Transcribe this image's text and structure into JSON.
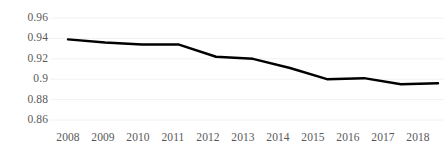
{
  "chart_data": {
    "type": "line",
    "title": "",
    "subtitle": "",
    "xlabel": "",
    "ylabel": "",
    "categories": [
      "2008",
      "2009",
      "2010",
      "2011",
      "2012",
      "2013",
      "2014",
      "2015",
      "2016",
      "2017",
      "2018"
    ],
    "x": [
      2008,
      2009,
      2010,
      2011,
      2012,
      2013,
      2014,
      2015,
      2016,
      2017,
      2018
    ],
    "values": [
      0.939,
      0.936,
      0.934,
      0.934,
      0.922,
      0.92,
      0.911,
      0.9,
      0.901,
      0.895,
      0.896
    ],
    "series": [
      {
        "name": "",
        "values": [
          0.939,
          0.936,
          0.934,
          0.934,
          0.922,
          0.92,
          0.911,
          0.9,
          0.901,
          0.895,
          0.896
        ]
      }
    ],
    "ylim": [
      0.86,
      0.96
    ],
    "xlim": [
      2008,
      2018
    ],
    "yticks": [
      0.96,
      0.94,
      0.92,
      0.9,
      0.88,
      0.86
    ],
    "ytick_labels": [
      "0.96",
      "0.94",
      "0.92",
      "0.9",
      "0.88",
      "0.86"
    ],
    "xtick_labels": [
      "2008",
      "2009",
      "2010",
      "2011",
      "2012",
      "2013",
      "2014",
      "2015",
      "2016",
      "2017",
      "2018"
    ],
    "grid": true,
    "grid_axis": "y",
    "legend": false,
    "legend_position": "none",
    "markers": false,
    "line_color": "#000000",
    "line_width": 2.4,
    "grid_color": "#f2f2f2",
    "tick_label_color": "#595959",
    "background_color": "#ffffff",
    "annotations": []
  },
  "axes": {
    "y_tick_0": "0.96",
    "y_tick_1": "0.94",
    "y_tick_2": "0.92",
    "y_tick_3": "0.9",
    "y_tick_4": "0.88",
    "y_tick_5": "0.86",
    "x_tick_0": "2008",
    "x_tick_1": "2009",
    "x_tick_2": "2010",
    "x_tick_3": "2011",
    "x_tick_4": "2012",
    "x_tick_5": "2013",
    "x_tick_6": "2014",
    "x_tick_7": "2015",
    "x_tick_8": "2016",
    "x_tick_9": "2017",
    "x_tick_10": "2018"
  }
}
